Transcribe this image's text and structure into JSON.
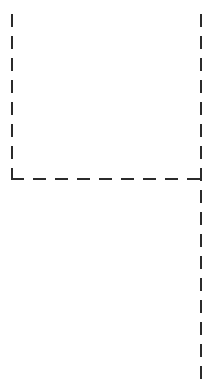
{
  "canvas": {
    "width": 218,
    "height": 389,
    "background_color": "#ffffff",
    "description": "Dashed guideline overlay forming an open rectangular boundary"
  },
  "style": {
    "stroke_color": "#2b2b2b",
    "stroke_width": 2,
    "dash_length": 13,
    "gap_length": 9,
    "dash_array": "13 9",
    "line_cap": "butt"
  },
  "guides": {
    "left_vertical": {
      "name": "left-boundary",
      "orientation": "vertical",
      "x": 12,
      "y_start": 14,
      "y_end": 180,
      "length": 166
    },
    "horizontal": {
      "name": "bottom-boundary",
      "orientation": "horizontal",
      "y": 179,
      "x_start": 11,
      "x_end": 202,
      "length": 191
    },
    "right_vertical": {
      "name": "right-boundary",
      "orientation": "vertical",
      "x": 201,
      "y_start": 14,
      "y_end": 379,
      "length": 365
    }
  },
  "junctions": {
    "corner": {
      "name": "bottom-left-corner",
      "x": 12,
      "y": 179,
      "type": "L-corner"
    },
    "tee": {
      "name": "right-tee-junction",
      "x": 201,
      "y": 179,
      "type": "T-junction"
    }
  }
}
